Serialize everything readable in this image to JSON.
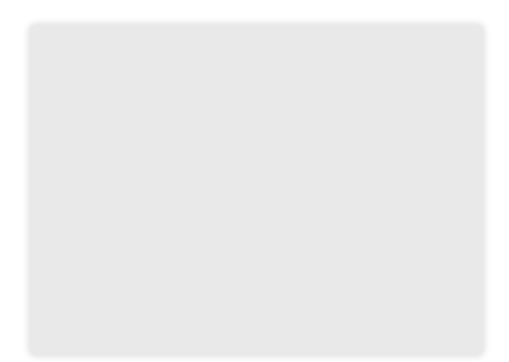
{
  "figure": {
    "axes": {
      "origin_label": "O",
      "x_ticks": [
        {
          "value": 5,
          "label": "5"
        },
        {
          "value": 10,
          "label": "10"
        },
        {
          "value": 15,
          "label": "15"
        }
      ],
      "y_ticks": [
        {
          "value": 2,
          "label": "2"
        },
        {
          "value": 4,
          "label": "4"
        },
        {
          "value": 6,
          "label": "6"
        },
        {
          "value": 8,
          "label": "8"
        },
        {
          "value": 10,
          "label": "10"
        }
      ],
      "x_range": [
        -3,
        17
      ],
      "y_range": [
        -2,
        12
      ]
    },
    "points": {
      "A": {
        "x": 0,
        "y": 0,
        "label_top": "A = A′",
        "label_bottom": "(0, 0)"
      },
      "B": {
        "x": 5,
        "y": 4,
        "label": "B(5, 4)"
      },
      "C": {
        "x": 6,
        "y": 1,
        "label": "C(6, 1)"
      },
      "B_prime": {
        "x": 10,
        "y": 8,
        "label": "B′"
      },
      "C_prime": {
        "x": 12,
        "y": 2,
        "label": "C′"
      }
    },
    "segments": [
      [
        "A",
        "B_prime"
      ],
      [
        "B_prime",
        "C_prime"
      ],
      [
        "C_prime",
        "A"
      ],
      [
        "B",
        "C"
      ]
    ],
    "colors": {
      "board": "#e9e9e9",
      "grid": "#a9a9a9",
      "lines": "#111111"
    }
  }
}
